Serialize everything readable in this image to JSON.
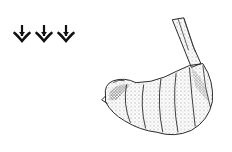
{
  "illustration": {
    "subject": "shrimp",
    "style": "stippled line drawing",
    "ink_color": "#1a1a1a",
    "background": "#ffffff"
  },
  "icons": [
    {
      "name": "trident-arrow-icon"
    },
    {
      "name": "trident-arrow-icon"
    },
    {
      "name": "trident-arrow-icon"
    }
  ]
}
